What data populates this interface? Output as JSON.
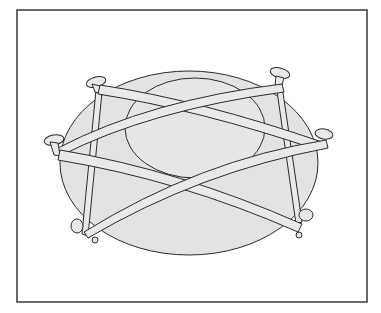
{
  "figure": {
    "colors": {
      "background": "#ffffff",
      "frame": "#3a3a3a",
      "oval_fill": "#e3e3e3",
      "nail_fill": "#e9e9e9",
      "stroke": "#2a2a2a"
    },
    "nail_count": 6
  }
}
